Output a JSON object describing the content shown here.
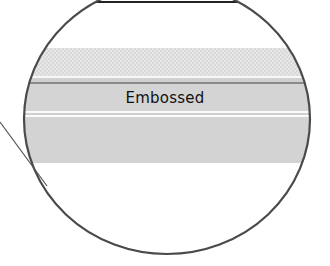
{
  "diagram": {
    "type": "magnified-callout",
    "label": "Embossed",
    "bands": [
      {
        "name": "hatched-band",
        "style": "dotted-pattern"
      },
      {
        "name": "embossed-band",
        "label": "Embossed"
      },
      {
        "name": "lower-band",
        "style": "flat-gray"
      }
    ],
    "colors": {
      "outline": "#4a4a4a",
      "band_gray": "#d4d4d4",
      "text": "#111111"
    }
  }
}
